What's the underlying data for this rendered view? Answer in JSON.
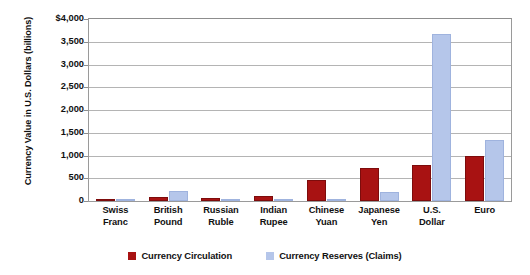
{
  "chart_data": {
    "type": "bar",
    "title": "",
    "xlabel": "",
    "ylabel": "Currency Value in U.S. Dollars (billions)",
    "ylim": [
      0,
      4000
    ],
    "ytick_labels": [
      "$4,000",
      "3,500",
      "3,000",
      "2,500",
      "2,000",
      "1,500",
      "1,000",
      "500",
      "0"
    ],
    "ytick_values": [
      4000,
      3500,
      3000,
      2500,
      2000,
      1500,
      1000,
      500,
      0
    ],
    "grid": true,
    "legend_position": "bottom",
    "categories": [
      "Swiss Franc",
      "British Pound",
      "Russian Ruble",
      "Indian Rupee",
      "Chinese Yuan",
      "Japanese Yen",
      "U.S. Dollar",
      "Euro"
    ],
    "category_lines": [
      [
        "Swiss",
        "Franc"
      ],
      [
        "British",
        "Pound"
      ],
      [
        "Russian",
        "Ruble"
      ],
      [
        "Indian",
        "Rupee"
      ],
      [
        "Chinese",
        "Yuan"
      ],
      [
        "Japanese",
        "Yen"
      ],
      [
        "U.S.",
        "Dollar"
      ],
      [
        "Euro",
        ""
      ]
    ],
    "series": [
      {
        "name": "Currency Circulation",
        "color": "#a81212",
        "values": [
          55,
          95,
          75,
          110,
          470,
          720,
          800,
          1000
        ]
      },
      {
        "name": "Currency Reserves (Claims)",
        "color": "#b5c6ea",
        "values": [
          10,
          220,
          5,
          5,
          5,
          200,
          3680,
          1350
        ]
      }
    ]
  },
  "legend": {
    "items": [
      {
        "label": "Currency Circulation",
        "swatch": "#a81212"
      },
      {
        "label": "Currency Reserves (Claims)",
        "swatch": "#b5c6ea"
      }
    ]
  }
}
